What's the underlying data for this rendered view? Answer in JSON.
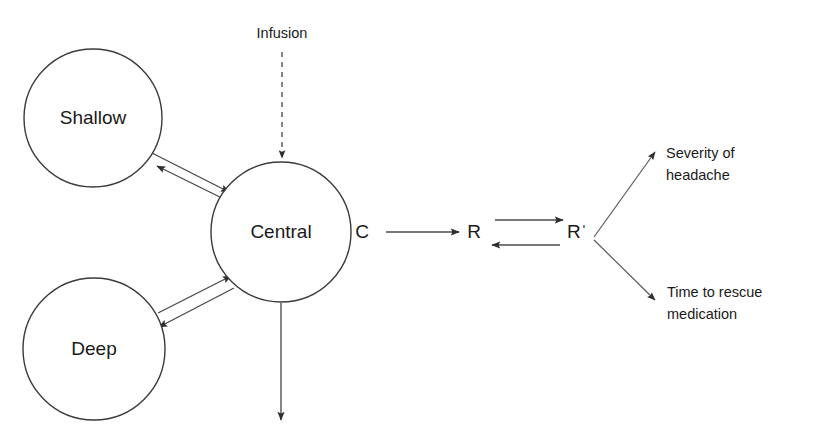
{
  "diagram": {
    "background_color": "#ffffff",
    "stroke_color": "#4a4a4a",
    "text_color": "#1a1a1a"
  },
  "compartments": [
    {
      "id": "shallow",
      "label": "Shallow",
      "cx": 93,
      "cy": 118,
      "r": 69
    },
    {
      "id": "central",
      "label": "Central",
      "cx": 281,
      "cy": 232,
      "r": 70
    },
    {
      "id": "deep",
      "label": "Deep",
      "cx": 94,
      "cy": 349,
      "r": 71
    }
  ],
  "inputs": [
    {
      "id": "infusion",
      "label": "Infusion",
      "style": "dashed",
      "x": 282,
      "y": 38
    }
  ],
  "effect_nodes": [
    {
      "id": "c",
      "label": "C",
      "x": 362,
      "y": 232
    },
    {
      "id": "r",
      "label": "R",
      "x": 474,
      "y": 232
    },
    {
      "id": "r-prime",
      "label": "Rˈ",
      "x": 577,
      "y": 232
    }
  ],
  "outcomes": [
    {
      "id": "severity-of-headache",
      "lines": [
        "Severity of",
        "headache"
      ],
      "x": 666,
      "y1": 158,
      "y2": 180
    },
    {
      "id": "time-to-rescue-medication",
      "lines": [
        "Time to rescue",
        "medication"
      ],
      "x": 667,
      "y1": 297,
      "y2": 319
    }
  ],
  "elimination": {
    "id": "elimination-arrow",
    "from_x": 281,
    "from_y": 303,
    "to_x": 281,
    "to_y": 420
  }
}
